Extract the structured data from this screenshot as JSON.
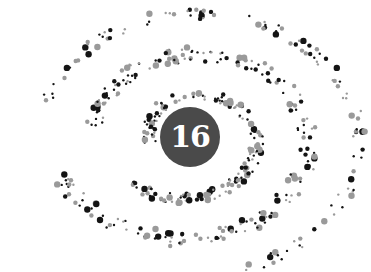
{
  "plate": {
    "number": "16",
    "badge_color": "#4a4a4a",
    "number_color": "#ffffff"
  },
  "dot_colors": {
    "dark": "#141414",
    "light": "#9a9a9a"
  },
  "spiral": {
    "center": [
      190,
      137
    ],
    "arms": 3
  }
}
